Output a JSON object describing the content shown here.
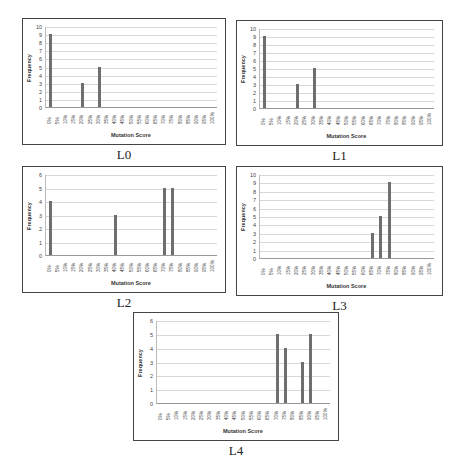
{
  "chart_data": [
    {
      "id": "L0",
      "type": "bar",
      "caption": "L0",
      "xlabel": "Mutation Score",
      "ylabel": "Frequency",
      "ylim": [
        0,
        10
      ],
      "yticks": [
        0,
        1,
        2,
        3,
        4,
        5,
        6,
        7,
        8,
        9,
        10
      ],
      "grid": true,
      "categories": [
        "0%",
        "5%",
        "10%",
        "15%",
        "20%",
        "25%",
        "30%",
        "35%",
        "40%",
        "45%",
        "50%",
        "55%",
        "60%",
        "65%",
        "70%",
        "75%",
        "80%",
        "85%",
        "90%",
        "95%",
        "100%"
      ],
      "values": [
        9,
        0,
        0,
        0,
        3,
        0,
        5,
        0,
        0,
        0,
        0,
        0,
        0,
        0,
        0,
        0,
        0,
        0,
        0,
        0,
        0
      ],
      "frame": {
        "x": 22,
        "y": 18,
        "w": 204,
        "h": 127
      }
    },
    {
      "id": "L1",
      "type": "bar",
      "caption": "L1",
      "xlabel": "Mutation Score",
      "ylabel": "Frequency",
      "ylim": [
        0,
        10
      ],
      "yticks": [
        0,
        1,
        2,
        3,
        4,
        5,
        6,
        7,
        8,
        9,
        10
      ],
      "grid": true,
      "categories": [
        "0%",
        "5%",
        "10%",
        "15%",
        "20%",
        "25%",
        "30%",
        "35%",
        "40%",
        "45%",
        "50%",
        "55%",
        "60%",
        "65%",
        "70%",
        "75%",
        "80%",
        "85%",
        "90%",
        "95%",
        "100%"
      ],
      "values": [
        9,
        0,
        0,
        0,
        3,
        0,
        5,
        0,
        0,
        0,
        0,
        0,
        0,
        0,
        0,
        0,
        0,
        0,
        0,
        0,
        0
      ],
      "frame": {
        "x": 236,
        "y": 20,
        "w": 207,
        "h": 126
      }
    },
    {
      "id": "L2",
      "type": "bar",
      "caption": "L2",
      "xlabel": "Mutation Score",
      "ylabel": "Frequency",
      "ylim": [
        0,
        6
      ],
      "yticks": [
        0,
        1,
        2,
        3,
        4,
        5,
        6
      ],
      "grid": true,
      "categories": [
        "0%",
        "5%",
        "10%",
        "15%",
        "20%",
        "25%",
        "30%",
        "35%",
        "40%",
        "45%",
        "50%",
        "55%",
        "60%",
        "65%",
        "70%",
        "75%",
        "80%",
        "85%",
        "90%",
        "95%",
        "100%"
      ],
      "values": [
        4,
        0,
        0,
        0,
        0,
        0,
        0,
        0,
        3,
        0,
        0,
        0,
        0,
        0,
        5,
        5,
        0,
        0,
        0,
        0,
        0
      ],
      "frame": {
        "x": 22,
        "y": 166,
        "w": 204,
        "h": 127
      }
    },
    {
      "id": "L3",
      "type": "bar",
      "caption": "L3",
      "xlabel": "Mutation Score",
      "ylabel": "Frequency",
      "ylim": [
        0,
        10
      ],
      "yticks": [
        0,
        1,
        2,
        3,
        4,
        5,
        6,
        7,
        8,
        9,
        10
      ],
      "grid": true,
      "categories": [
        "0%",
        "5%",
        "10%",
        "15%",
        "20%",
        "25%",
        "30%",
        "35%",
        "40%",
        "45%",
        "50%",
        "55%",
        "60%",
        "65%",
        "70%",
        "75%",
        "80%",
        "85%",
        "90%",
        "95%",
        "100%"
      ],
      "values": [
        0,
        0,
        0,
        0,
        0,
        0,
        0,
        0,
        0,
        0,
        0,
        0,
        0,
        3,
        5,
        9,
        0,
        0,
        0,
        0,
        0
      ],
      "frame": {
        "x": 236,
        "y": 166,
        "w": 207,
        "h": 130
      }
    },
    {
      "id": "L4",
      "type": "bar",
      "caption": "L4",
      "xlabel": "Mutation Score",
      "ylabel": "Frequency",
      "ylim": [
        0,
        6
      ],
      "yticks": [
        0,
        1,
        2,
        3,
        4,
        5,
        6
      ],
      "grid": true,
      "categories": [
        "0%",
        "5%",
        "10%",
        "15%",
        "20%",
        "25%",
        "30%",
        "35%",
        "40%",
        "45%",
        "50%",
        "55%",
        "60%",
        "65%",
        "70%",
        "75%",
        "80%",
        "85%",
        "90%",
        "95%",
        "100%"
      ],
      "values": [
        0,
        0,
        0,
        0,
        0,
        0,
        0,
        0,
        0,
        0,
        0,
        0,
        0,
        0,
        5,
        4,
        0,
        3,
        5,
        0,
        0
      ],
      "frame": {
        "x": 133,
        "y": 312,
        "w": 206,
        "h": 129
      }
    }
  ],
  "colors": {
    "bar": "#6e6e6e",
    "grid": "#d8d8d8",
    "frame": "#444444"
  }
}
